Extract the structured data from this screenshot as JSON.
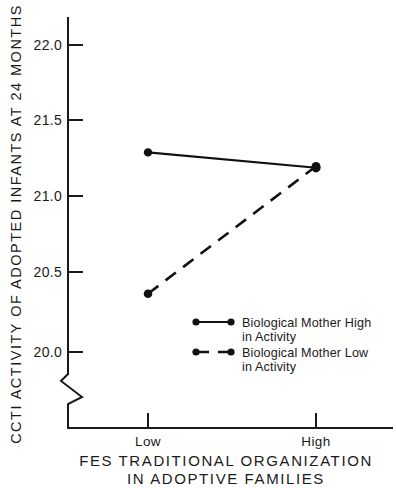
{
  "chart_data": {
    "type": "line",
    "title": "",
    "subtitle": "",
    "xlabel_line1": "FES TRADITIONAL ORGANIZATION",
    "xlabel_line2": "IN ADOPTIVE FAMILIES",
    "ylabel": "CCTI ACTIVITY OF ADOPTED INFANTS AT 24 MONTHS",
    "categories": [
      "Low",
      "High"
    ],
    "xtick_labels": [
      "Low",
      "High"
    ],
    "ytick_labels": [
      "22.0",
      "21.5",
      "21.0",
      "20.5",
      "20.0"
    ],
    "ytick_values": [
      22.0,
      21.5,
      21.0,
      20.5,
      20.0
    ],
    "ylim": [
      20.0,
      22.0
    ],
    "y_axis_broken": true,
    "grid": false,
    "legend_position": "inside-lower-right",
    "series": [
      {
        "name": "Biological Mother High in Activity",
        "name_line1": "Biological Mother High",
        "name_line2": "in Activity",
        "style": "solid",
        "marker": "filled-circle",
        "values": [
          21.3,
          21.2
        ]
      },
      {
        "name": "Biological Mother Low in Activity",
        "name_line1": "Biological Mother Low",
        "name_line2": "in Activity",
        "style": "dashed",
        "marker": "filled-circle",
        "values": [
          20.38,
          21.21
        ]
      }
    ],
    "colors": {
      "line": "#111111",
      "axis": "#1a1a1a",
      "background": "#ffffff"
    }
  }
}
